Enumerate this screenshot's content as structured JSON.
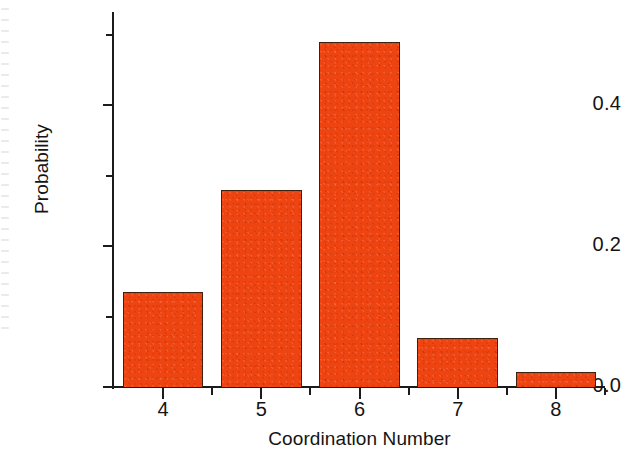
{
  "chart_data": {
    "type": "bar",
    "title": "",
    "xlabel": "Coordination Number",
    "ylabel": "Probability",
    "categories": [
      "4",
      "5",
      "6",
      "7",
      "8"
    ],
    "values": [
      0.135,
      0.28,
      0.49,
      0.07,
      0.022
    ],
    "series": [
      {
        "name": "Probability",
        "values": [
          0.135,
          0.28,
          0.49,
          0.07,
          0.022
        ]
      }
    ],
    "xlim": [
      3.5,
      8.5
    ],
    "ylim": [
      0.0,
      0.535
    ],
    "grid": false,
    "legend": null,
    "bar_color": "#ee4411",
    "bar_edge_color": "#40210f",
    "axis_color": "#1b1b1b",
    "background_color": "#ffffff",
    "y_ticks": [
      {
        "value": 0.0,
        "label": "0.0",
        "type": "major"
      },
      {
        "value": 0.1,
        "label": "",
        "type": "minor"
      },
      {
        "value": 0.2,
        "label": "0.2",
        "type": "major"
      },
      {
        "value": 0.3,
        "label": "",
        "type": "minor"
      },
      {
        "value": 0.4,
        "label": "0.4",
        "type": "major"
      },
      {
        "value": 0.5,
        "label": "",
        "type": "minor"
      }
    ],
    "x_ticks": [
      {
        "value": 4,
        "label": "4",
        "type": "major"
      },
      {
        "value": 4.5,
        "label": "",
        "type": "minor"
      },
      {
        "value": 5,
        "label": "5",
        "type": "major"
      },
      {
        "value": 5.5,
        "label": "",
        "type": "minor"
      },
      {
        "value": 6,
        "label": "6",
        "type": "major"
      },
      {
        "value": 6.5,
        "label": "",
        "type": "minor"
      },
      {
        "value": 7,
        "label": "7",
        "type": "major"
      },
      {
        "value": 7.5,
        "label": "",
        "type": "minor"
      },
      {
        "value": 8,
        "label": "8",
        "type": "major"
      },
      {
        "value": 8.5,
        "label": "",
        "type": "minor"
      }
    ]
  },
  "axis": {
    "y_title": "Probability",
    "x_title": "Coordination Number",
    "y_tick_labels": [
      "0.0",
      "0.2",
      "0.4"
    ],
    "x_tick_labels": [
      "4",
      "5",
      "6",
      "7",
      "8"
    ]
  }
}
